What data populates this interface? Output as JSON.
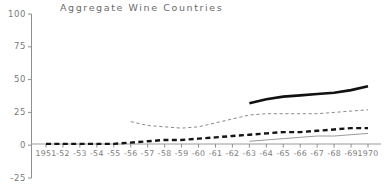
{
  "chart_data": {
    "type": "line",
    "title": "Aggregate Wine Countries",
    "xlabel": "",
    "ylabel": "",
    "ylim": [
      -25,
      100
    ],
    "yticks": [
      100,
      75,
      50,
      25,
      0,
      -25
    ],
    "ytick_labels": [
      "100",
      "75",
      "50",
      "25",
      "0",
      "-25"
    ],
    "grid": false,
    "legend": "none",
    "x": [
      1951,
      1952,
      1953,
      1954,
      1955,
      1956,
      1957,
      1958,
      1959,
      1960,
      1961,
      1962,
      1963,
      1964,
      1965,
      1966,
      1967,
      1968,
      1969,
      1970
    ],
    "xtick_labels": [
      "1951",
      "-52",
      "-53",
      "-54",
      "-55",
      "-56",
      "-57",
      "-58",
      "-59",
      "-60",
      "-61",
      "-62",
      "-63",
      "-64",
      "-65",
      "-66",
      "-67",
      "-68",
      "-69",
      "1970"
    ],
    "series": [
      {
        "name": "thick-solid-series",
        "style": "solid",
        "width": 2.6,
        "color": "#111111",
        "x": [
          1963,
          1964,
          1965,
          1966,
          1967,
          1968,
          1969,
          1970
        ],
        "values": [
          32,
          35,
          37,
          38,
          39,
          40,
          42,
          45
        ]
      },
      {
        "name": "thin-dashed-series",
        "style": "dashed-fine",
        "width": 1.0,
        "color": "#8a8a8a",
        "x": [
          1956,
          1957,
          1958,
          1959,
          1960,
          1961,
          1962,
          1963,
          1964,
          1965,
          1966,
          1967,
          1968,
          1969,
          1970
        ],
        "values": [
          18,
          15,
          14,
          13,
          14,
          17,
          20,
          23,
          24,
          24,
          24,
          24,
          25,
          26,
          27
        ]
      },
      {
        "name": "thick-dashed-series",
        "style": "dashed-bold",
        "width": 2.4,
        "color": "#141414",
        "x": [
          1951,
          1952,
          1953,
          1954,
          1955,
          1956,
          1957,
          1958,
          1959,
          1960,
          1961,
          1962,
          1963,
          1964,
          1965,
          1966,
          1967,
          1968,
          1969,
          1970
        ],
        "values": [
          1,
          1,
          1,
          1,
          1,
          2,
          3,
          4,
          4,
          5,
          6,
          7,
          8,
          9,
          10,
          10,
          11,
          12,
          13,
          13
        ]
      },
      {
        "name": "thin-solid-series",
        "style": "solid",
        "width": 1.0,
        "color": "#9a9a9a",
        "x": [
          1963,
          1964,
          1965,
          1966,
          1967,
          1968,
          1969,
          1970
        ],
        "values": [
          3,
          4,
          5,
          6,
          7,
          7,
          8,
          9
        ]
      }
    ]
  },
  "axis": {
    "zero_baseline_color": "#9a9a9a",
    "axis_color": "#8e8e8e"
  }
}
